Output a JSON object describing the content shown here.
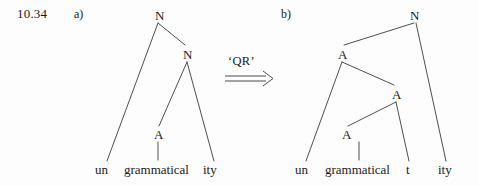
{
  "example_number": "10.34",
  "background_color": "#fdfdfd",
  "ink_color": "#3a3a3a",
  "operation": {
    "label": "‘QR’",
    "arrow_glyph": "double-right-arrow"
  },
  "panels": [
    {
      "id": "a",
      "label": "a)",
      "tree": {
        "nodes": [
          {
            "id": "a-n-root",
            "text": "N",
            "x": 159,
            "y": 15
          },
          {
            "id": "a-n-inner",
            "text": "N",
            "x": 187,
            "y": 54
          },
          {
            "id": "a-a",
            "text": "A",
            "x": 158,
            "y": 134
          }
        ],
        "leaves": [
          {
            "id": "a-leaf-un",
            "text": "un",
            "x": 104,
            "y": 170
          },
          {
            "id": "a-leaf-grammatical",
            "text": "grammatical",
            "x": 159,
            "y": 170
          },
          {
            "id": "a-leaf-ity",
            "text": "ity",
            "x": 212,
            "y": 170
          }
        ],
        "branches": [
          {
            "from": "a-n-root",
            "to": "a-leaf-un",
            "x1": 158,
            "y1": 23,
            "x2": 107,
            "y2": 161
          },
          {
            "from": "a-n-root",
            "to": "a-n-inner",
            "x1": 158,
            "y1": 23,
            "x2": 185,
            "y2": 45
          },
          {
            "from": "a-n-inner",
            "to": "a-a",
            "x1": 187,
            "y1": 62,
            "x2": 159,
            "y2": 126
          },
          {
            "from": "a-n-inner",
            "to": "a-leaf-ity",
            "x1": 187,
            "y1": 62,
            "x2": 214,
            "y2": 161
          },
          {
            "from": "a-a",
            "to": "a-leaf-grammatical",
            "x1": 158,
            "y1": 142,
            "x2": 158,
            "y2": 160
          }
        ]
      }
    },
    {
      "id": "b",
      "label": "b)",
      "tree": {
        "nodes": [
          {
            "id": "b-n-root",
            "text": "N",
            "x": 414,
            "y": 15
          },
          {
            "id": "b-a-top",
            "text": "A",
            "x": 342,
            "y": 54
          },
          {
            "id": "b-a-mid",
            "text": "A",
            "x": 396,
            "y": 94
          },
          {
            "id": "b-a-low",
            "text": "A",
            "x": 346,
            "y": 134
          }
        ],
        "leaves": [
          {
            "id": "b-leaf-un",
            "text": "un",
            "x": 304,
            "y": 170
          },
          {
            "id": "b-leaf-grammatical",
            "text": "grammatical",
            "x": 360,
            "y": 170
          },
          {
            "id": "b-leaf-t",
            "text": "t",
            "x": 409,
            "y": 170
          },
          {
            "id": "b-leaf-ity",
            "text": "ity",
            "x": 447,
            "y": 170
          }
        ],
        "branches": [
          {
            "from": "b-n-root",
            "to": "b-a-top",
            "x1": 414,
            "y1": 23,
            "x2": 344,
            "y2": 45
          },
          {
            "from": "b-n-root",
            "to": "b-leaf-ity",
            "x1": 416,
            "y1": 23,
            "x2": 446,
            "y2": 161
          },
          {
            "from": "b-a-top",
            "to": "b-leaf-un",
            "x1": 342,
            "y1": 62,
            "x2": 306,
            "y2": 161
          },
          {
            "from": "b-a-top",
            "to": "b-a-mid",
            "x1": 342,
            "y1": 62,
            "x2": 394,
            "y2": 85
          },
          {
            "from": "b-a-mid",
            "to": "b-a-low",
            "x1": 396,
            "y1": 102,
            "x2": 348,
            "y2": 126
          },
          {
            "from": "b-a-mid",
            "to": "b-leaf-t",
            "x1": 396,
            "y1": 102,
            "x2": 409,
            "y2": 161
          },
          {
            "from": "b-a-low",
            "to": "b-leaf-grammatical",
            "x1": 359,
            "y1": 142,
            "x2": 359,
            "y2": 160
          }
        ]
      }
    }
  ]
}
